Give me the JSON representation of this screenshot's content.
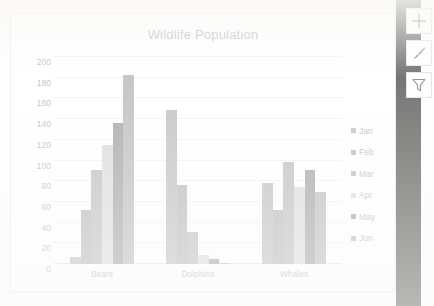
{
  "application": {
    "context": "spreadsheet-embedded-chart",
    "side_panel_color": "#1a1a18"
  },
  "chart_buttons": [
    {
      "name": "chart-elements-button",
      "icon": "plus-icon",
      "label": "Chart Elements"
    },
    {
      "name": "chart-styles-button",
      "icon": "paintbrush-icon",
      "label": "Chart Styles"
    },
    {
      "name": "chart-filters-button",
      "icon": "funnel-icon",
      "label": "Chart Filters"
    }
  ],
  "chart_data": {
    "type": "bar",
    "title": "Wildlife Population",
    "xlabel": "",
    "ylabel": "",
    "ylim": [
      0,
      200
    ],
    "y_ticks": [
      0,
      20,
      40,
      60,
      80,
      100,
      120,
      140,
      160,
      180,
      200
    ],
    "grid": true,
    "legend_position": "right",
    "categories": [
      "Bears",
      "Dolphins",
      "Whales"
    ],
    "series": [
      {
        "name": "Jan",
        "color": "#a6a6a6",
        "values": [
          7,
          149,
          78
        ]
      },
      {
        "name": "Feb",
        "color": "#9c9c9c",
        "values": [
          52,
          76,
          52
        ]
      },
      {
        "name": "Mar",
        "color": "#a3a3a3",
        "values": [
          91,
          31,
          99
        ]
      },
      {
        "name": "Apr",
        "color": "#cdcdcd",
        "values": [
          115,
          9,
          74
        ]
      },
      {
        "name": "May",
        "color": "#7e7e7e",
        "values": [
          136,
          5,
          91
        ]
      },
      {
        "name": "Jun",
        "color": "#a0a0a0",
        "values": [
          183,
          1,
          70
        ]
      }
    ]
  }
}
